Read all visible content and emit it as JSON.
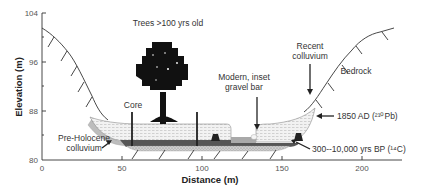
{
  "figure": {
    "type": "cross-section",
    "x_axis": {
      "title": "Distance (m)",
      "ticks": [
        "0",
        "50",
        "100",
        "150",
        "200"
      ],
      "range": [
        0,
        225
      ]
    },
    "y_axis": {
      "title": "Elevation (m)",
      "ticks": [
        "80",
        "88",
        "96",
        "104"
      ],
      "range": [
        80,
        104
      ]
    },
    "annotations": {
      "trees": "Trees >100 yrs old",
      "core": "Core",
      "pre_holocene_line1": "Pre-Holocene",
      "pre_holocene_line2": "colluvium",
      "gravel_bar_line1": "Modern, inset",
      "gravel_bar_line2": "gravel bar",
      "recent_colluvium_line1": "Recent",
      "recent_colluvium_line2": "colluvium",
      "bedrock": "Bedrock",
      "date_1850": "1850 AD (²¹⁰Pb)",
      "date_14c": "300--10,000 yrs BP (¹⁴C)"
    },
    "layers": [
      {
        "name": "Post-1850 sediment",
        "pattern": "light stippled"
      },
      {
        "name": "1850 AD surface",
        "pattern": "dark band"
      },
      {
        "name": "300-10,000 yrs BP",
        "pattern": "dense stipple"
      },
      {
        "name": "Pre-Holocene colluvium",
        "pattern": "grey wedge"
      }
    ],
    "cores": [
      {
        "distance_m": 56
      },
      {
        "distance_m": 97
      }
    ]
  }
}
